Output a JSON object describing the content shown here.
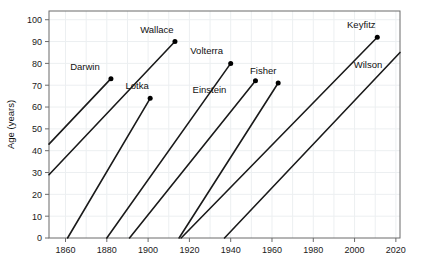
{
  "chart_data": {
    "type": "line",
    "title": "",
    "xlabel": "",
    "ylabel": "Age (years)",
    "xlim": [
      1852,
      2022
    ],
    "ylim": [
      0,
      104
    ],
    "xticks": [
      1860,
      1880,
      1900,
      1920,
      1940,
      1960,
      1980,
      2000,
      2020
    ],
    "yticks": [
      0,
      10,
      20,
      30,
      40,
      50,
      60,
      70,
      80,
      90,
      100
    ],
    "grid": true,
    "legend": "none",
    "annotation_note": "Each line is a lifespan: it rises one year of age per calendar year from birth (age 0) to death age, marked by a dot labelled with the person's name.",
    "series": [
      {
        "name": "Darwin",
        "birth_year": 1809,
        "death_year": 1882,
        "death_age": 73,
        "start_x": 1852,
        "start_y": 43,
        "end_x": 1882,
        "end_y": 73,
        "has_end_dot": true,
        "label_dx": -26,
        "label_dy": -9
      },
      {
        "name": "Wallace",
        "birth_year": 1823,
        "death_year": 1913,
        "death_age": 90,
        "start_x": 1852,
        "start_y": 29,
        "end_x": 1913,
        "end_y": 90,
        "has_end_dot": true,
        "label_dx": -18,
        "label_dy": -9
      },
      {
        "name": "Lotka",
        "birth_year": 1880,
        "death_year": 1949,
        "death_age": 69,
        "start_x": 1861,
        "start_y": 0,
        "end_x": 1901,
        "end_y": 64,
        "has_end_dot": true,
        "label_dx": -13,
        "label_dy": -9
      },
      {
        "name": "Volterra",
        "birth_year": 1860,
        "death_year": 1940,
        "death_age": 80,
        "start_x": 1880,
        "start_y": 0,
        "end_x": 1940,
        "end_y": 80,
        "has_end_dot": true,
        "label_dx": -24,
        "label_dy": -9
      },
      {
        "name": "Einstein",
        "birth_year": 1879,
        "death_year": 1955,
        "death_age": 76,
        "start_x": 1891,
        "start_y": 0,
        "end_x": 1952,
        "end_y": 72,
        "has_end_dot": true,
        "label_dx": -46,
        "label_dy": 12
      },
      {
        "name": "Fisher",
        "birth_year": 1890,
        "death_year": 1962,
        "death_age": 72,
        "start_x": 1915,
        "start_y": 0,
        "end_x": 1963,
        "end_y": 71,
        "has_end_dot": true,
        "label_dx": -15,
        "label_dy": -9
      },
      {
        "name": "Keyfitz",
        "birth_year": 1913,
        "death_year": 2010,
        "death_age": 97,
        "start_x": 1916,
        "start_y": 0,
        "end_x": 2011,
        "end_y": 92,
        "has_end_dot": true,
        "label_dx": -16,
        "label_dy": -9
      },
      {
        "name": "Wilson",
        "birth_year": 1929,
        "death_year": 2021,
        "death_age": 92,
        "start_x": 1937,
        "start_y": 0,
        "end_x": 2022,
        "end_y": 85,
        "has_end_dot": false,
        "label_dx": -32,
        "label_dy": 16
      }
    ]
  },
  "axes": {
    "y_axis_title": "Age (years)",
    "x_tick_labels": [
      "1860",
      "1880",
      "1900",
      "1920",
      "1940",
      "1960",
      "1980",
      "2000",
      "2020"
    ],
    "y_tick_labels": [
      "0",
      "10",
      "20",
      "30",
      "40",
      "50",
      "60",
      "70",
      "80",
      "90",
      "100"
    ]
  },
  "style": {
    "line_color": "#1a1a1a",
    "grid_color": "#eceff1",
    "frame_color": "#6b6b6b",
    "dot_color": "#000000",
    "background": "#ffffff"
  }
}
